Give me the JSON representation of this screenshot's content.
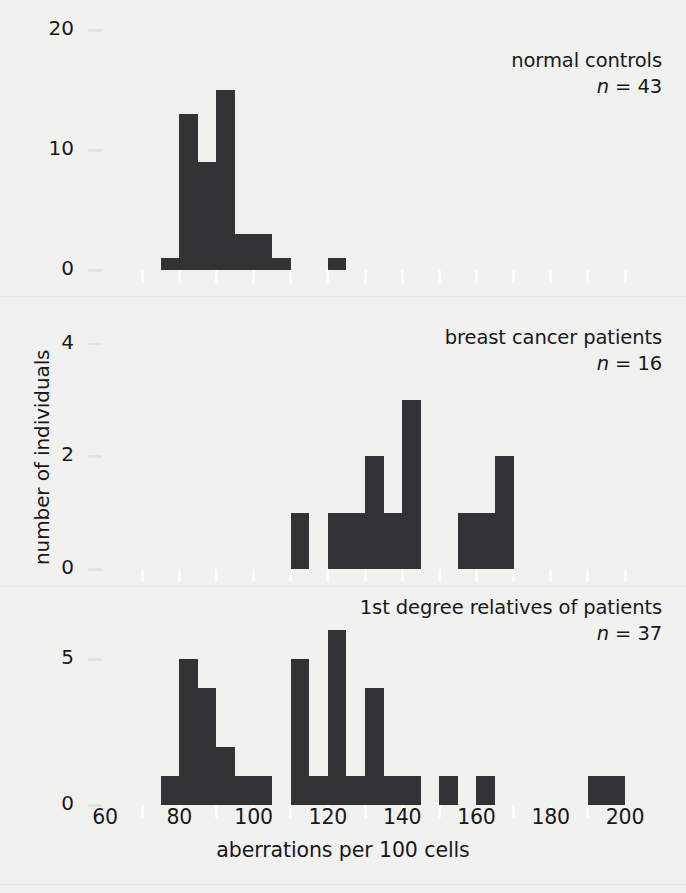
{
  "figure": {
    "background_color": "#f1f1f0",
    "bar_color": "#333335",
    "xlabel": "aberrations per 100 cells",
    "ylabel": "number of individuals"
  },
  "x_axis": {
    "min": 60,
    "max": 200,
    "tick_step": 10,
    "labeled_ticks": [
      60,
      80,
      100,
      120,
      140,
      160,
      180,
      200
    ],
    "label_strings": [
      "60",
      "80",
      "100",
      "120",
      "140",
      "160",
      "180",
      "200"
    ]
  },
  "chart_data": {
    "type": "bar",
    "title": "",
    "xlabel": "aberrations per 100 cells",
    "ylabel": "number of individuals",
    "xlim": [
      60,
      200
    ],
    "bin_width": 5,
    "grid": false,
    "legend": "none",
    "panels": [
      {
        "name": "normal-controls",
        "title": "normal controls",
        "n_label": "n = 43",
        "n_symbol": "n",
        "n_equals": "= 43",
        "n_value": 43,
        "ylim": [
          0,
          21
        ],
        "yticks": [
          0,
          10,
          20
        ],
        "ytick_labels": [
          "0",
          "10",
          "20"
        ],
        "bins_left": [
          75,
          80,
          85,
          90,
          95,
          100,
          105,
          120
        ],
        "values": [
          1,
          13,
          9,
          15,
          3,
          3,
          1,
          1
        ]
      },
      {
        "name": "breast-cancer-patients",
        "title": "breast cancer patients",
        "n_label": "n = 16",
        "n_symbol": "n",
        "n_equals": "= 16",
        "n_value": 16,
        "ylim": [
          0,
          4.6
        ],
        "yticks": [
          0,
          2,
          4
        ],
        "ytick_labels": [
          "0",
          "2",
          "4"
        ],
        "bins_left": [
          110,
          120,
          125,
          130,
          135,
          140,
          155,
          160,
          165
        ],
        "values": [
          1,
          1,
          1,
          2,
          1,
          3,
          1,
          1,
          2
        ]
      },
      {
        "name": "first-degree-relatives",
        "title": "1st degree relatives of patients",
        "n_label": "n = 37",
        "n_symbol": "n",
        "n_equals": "= 37",
        "n_value": 37,
        "ylim": [
          0,
          7.2
        ],
        "yticks": [
          0,
          5
        ],
        "ytick_labels": [
          "0",
          "5"
        ],
        "bins_left": [
          75,
          80,
          85,
          90,
          95,
          100,
          110,
          115,
          120,
          125,
          130,
          135,
          140,
          150,
          160,
          190,
          195
        ],
        "values": [
          1,
          5,
          4,
          2,
          1,
          1,
          5,
          1,
          6,
          1,
          4,
          1,
          1,
          1,
          1,
          1,
          1
        ]
      }
    ]
  }
}
